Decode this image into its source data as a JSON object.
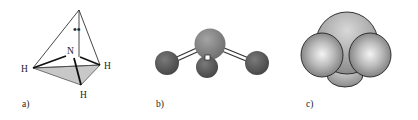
{
  "figure": {
    "panels": [
      {
        "id": "a",
        "label": "a)",
        "kind": "tetrahedral-geometry",
        "atoms": {
          "center": "N",
          "h1": "H",
          "h2": "H",
          "h3": "H"
        },
        "lone_pair": "••"
      },
      {
        "id": "b",
        "label": "b)",
        "kind": "ball-and-stick-model"
      },
      {
        "id": "c",
        "label": "c)",
        "kind": "space-filling-model"
      }
    ],
    "colors": {
      "line": "#222222",
      "face_fill": "#c8c8c8",
      "central_ball": "#8a8a8a",
      "outer_ball": "#5f5f5f",
      "bond": "#ffffff",
      "space_fill": "#b9b9b9"
    }
  }
}
